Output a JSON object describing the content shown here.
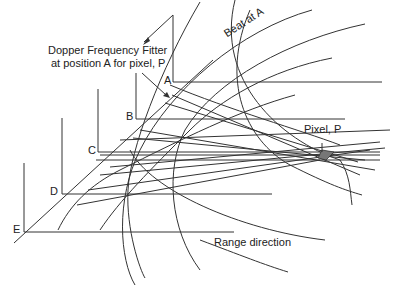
{
  "diagram": {
    "title_line1": "Dopper Frequency Fitter",
    "title_line2": "at position A for pixel, P",
    "beat_label": "Beat at A",
    "pixel_label": "Pixel, P",
    "range_label": "Range direction",
    "positions": [
      {
        "label": "A"
      },
      {
        "label": "B"
      },
      {
        "label": "C"
      },
      {
        "label": "D"
      },
      {
        "label": "E"
      }
    ],
    "colors": {
      "line": "#333333",
      "pixel_fill": "#777777",
      "background": "#ffffff"
    }
  }
}
